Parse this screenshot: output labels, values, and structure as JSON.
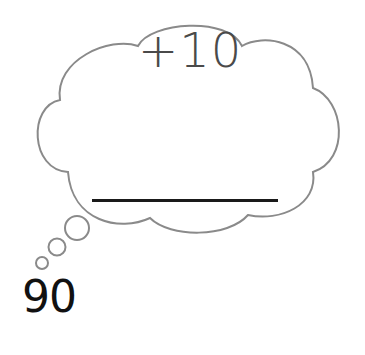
{
  "thought_bubble": {
    "operation": "+10",
    "answer_blank": ""
  },
  "start_number": "90",
  "colors": {
    "cloud_outline": "#8a8a8a",
    "operation_text": "#4a4a4a",
    "start_text": "#111111",
    "answer_line": "#1a1a1a"
  }
}
